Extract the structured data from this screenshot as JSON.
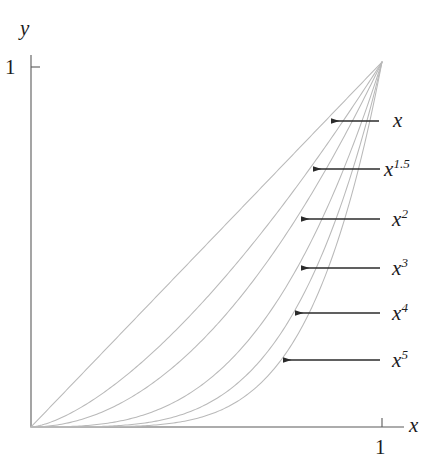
{
  "figure": {
    "background_color": "#ffffff",
    "axis_color": "#4d4d4d",
    "curve_color": "#b9b9b9",
    "arrow_color": "#2b2b2b",
    "text_color": "#1c1c1c",
    "origin": {
      "x": 31,
      "y": 427
    },
    "plot_right": 382,
    "plot_top": 62,
    "axes": {
      "x_axis_label": "x",
      "y_axis_label": "y",
      "x_tick_label": "1",
      "y_tick_label": "1",
      "x_tick_value": 1,
      "y_tick_value": 1,
      "top_clipped_text": "1"
    },
    "annotations": [
      {
        "label_html": "x",
        "exponent": "",
        "base": "x",
        "arrow_tip_x": 331,
        "arrow_tail_x": 379,
        "arrow_y": 121,
        "label_x": 393,
        "label_y": 110
      },
      {
        "label_html": "x1.5",
        "exponent": "1.5",
        "base": "x",
        "arrow_tip_x": 313,
        "arrow_tail_x": 380,
        "arrow_y": 169,
        "label_x": 384,
        "label_y": 159
      },
      {
        "label_html": "x2",
        "exponent": "2",
        "base": "x",
        "arrow_tip_x": 301,
        "arrow_tail_x": 380,
        "arrow_y": 219,
        "label_x": 392,
        "label_y": 209
      },
      {
        "label_html": "x3",
        "exponent": "3",
        "base": "x",
        "arrow_tip_x": 301,
        "arrow_tail_x": 380,
        "arrow_y": 268,
        "label_x": 392,
        "label_y": 258
      },
      {
        "label_html": "x4",
        "exponent": "4",
        "base": "x",
        "arrow_tip_x": 295,
        "arrow_tail_x": 380,
        "arrow_y": 313,
        "label_x": 392,
        "label_y": 303
      },
      {
        "label_html": "x5",
        "exponent": "5",
        "base": "x",
        "arrow_tip_x": 283,
        "arrow_tail_x": 380,
        "arrow_y": 360,
        "label_x": 392,
        "label_y": 350
      }
    ]
  },
  "chart_data": {
    "type": "line",
    "title": "",
    "xlabel": "x",
    "ylabel": "y",
    "xlim": [
      0,
      1
    ],
    "ylim": [
      0,
      1
    ],
    "xticks": [
      1
    ],
    "yticks": [
      1
    ],
    "xticklabels": [
      "1"
    ],
    "yticklabels": [
      "1"
    ],
    "grid": false,
    "legend": "arrow-annotations-right",
    "x": [
      0,
      0.05,
      0.1,
      0.15,
      0.2,
      0.25,
      0.3,
      0.35,
      0.4,
      0.45,
      0.5,
      0.55,
      0.6,
      0.65,
      0.7,
      0.75,
      0.8,
      0.85,
      0.9,
      0.95,
      1
    ],
    "series": [
      {
        "name": "x",
        "exponent": 1,
        "values": [
          0,
          0.05,
          0.1,
          0.15,
          0.2,
          0.25,
          0.3,
          0.35,
          0.4,
          0.45,
          0.5,
          0.55,
          0.6,
          0.65,
          0.7,
          0.75,
          0.8,
          0.85,
          0.9,
          0.95,
          1
        ]
      },
      {
        "name": "x^1.5",
        "exponent": 1.5,
        "values": [
          0,
          0.0112,
          0.0316,
          0.0581,
          0.0894,
          0.125,
          0.1643,
          0.2071,
          0.253,
          0.3018,
          0.3536,
          0.4079,
          0.4648,
          0.5241,
          0.5857,
          0.6495,
          0.7155,
          0.7835,
          0.8538,
          0.926,
          1
        ]
      },
      {
        "name": "x^2",
        "exponent": 2,
        "values": [
          0,
          0.0025,
          0.01,
          0.0225,
          0.04,
          0.0625,
          0.09,
          0.1225,
          0.16,
          0.2025,
          0.25,
          0.3025,
          0.36,
          0.4225,
          0.49,
          0.5625,
          0.64,
          0.7225,
          0.81,
          0.9025,
          1
        ]
      },
      {
        "name": "x^3",
        "exponent": 3,
        "values": [
          0,
          0.000125,
          0.001,
          0.0034,
          0.008,
          0.0156,
          0.027,
          0.0429,
          0.064,
          0.0911,
          0.125,
          0.1664,
          0.216,
          0.2746,
          0.343,
          0.4219,
          0.512,
          0.6141,
          0.729,
          0.8574,
          1
        ]
      },
      {
        "name": "x^4",
        "exponent": 4,
        "values": [
          0,
          6.25e-06,
          0.0001,
          0.0005,
          0.0016,
          0.0039,
          0.0081,
          0.015,
          0.0256,
          0.041,
          0.0625,
          0.0915,
          0.1296,
          0.1785,
          0.2401,
          0.3164,
          0.4096,
          0.522,
          0.6561,
          0.8145,
          1
        ]
      },
      {
        "name": "x^5",
        "exponent": 5,
        "values": [
          0,
          3e-07,
          1e-05,
          7.59e-05,
          0.00032,
          0.000977,
          0.00243,
          0.00525,
          0.01024,
          0.01845,
          0.03125,
          0.0503,
          0.07776,
          0.116,
          0.16807,
          0.2373,
          0.32768,
          0.4437,
          0.59049,
          0.7738,
          1
        ]
      }
    ]
  }
}
